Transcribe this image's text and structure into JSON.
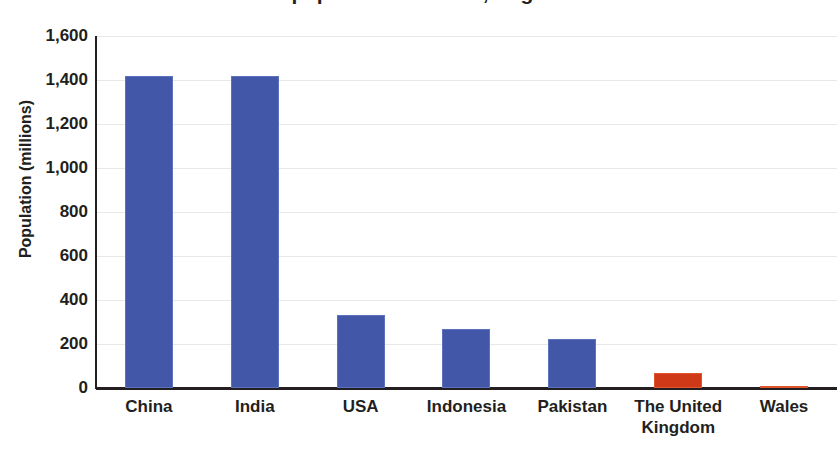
{
  "chart_data": {
    "type": "bar",
    "title": "World's most populous countries, England and Wales",
    "xlabel": "",
    "ylabel": "Population (millions)",
    "categories": [
      "China",
      "India",
      "USA",
      "Indonesia",
      "Pakistan",
      "The United Kingdom",
      "Wales"
    ],
    "values": [
      1420,
      1418,
      330,
      268,
      225,
      66,
      3
    ],
    "series": [
      {
        "name": "Population (millions)",
        "values": [
          1420,
          1418,
          330,
          268,
          225,
          66,
          3
        ]
      }
    ],
    "bar_colors": [
      "#4257a8",
      "#4257a8",
      "#4257a8",
      "#4257a8",
      "#4257a8",
      "#cf3917",
      "#cf3917"
    ],
    "ylim": [
      0,
      1600
    ],
    "ytick_values": [
      0,
      200,
      400,
      600,
      800,
      1000,
      1200,
      1400,
      1600
    ],
    "ytick_labels": [
      "0",
      "200",
      "400",
      "600",
      "800",
      "1,000",
      "1,200",
      "1,400",
      "1,600"
    ],
    "grid": true,
    "grid_axis": "y",
    "legend": false,
    "legend_position": "none",
    "accent_color_primary": "#4257a8",
    "accent_color_secondary": "#cf3917",
    "gridline_color": "#e8e8ea",
    "axis_color": "#231f20",
    "background": "#ffffff"
  }
}
